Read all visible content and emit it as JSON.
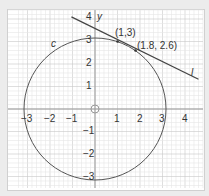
{
  "chart_data": {
    "type": "line",
    "title": "",
    "xlabel": "",
    "ylabel": "y",
    "xlim": [
      -3.3,
      4.6
    ],
    "ylim": [
      -3.3,
      4.0
    ],
    "grid": true,
    "x_ticks": [
      "-3",
      "-2",
      "-1",
      "1",
      "2",
      "3",
      "4"
    ],
    "y_ticks": [
      "4",
      "3",
      "2",
      "1",
      "-1",
      "-2",
      "-3"
    ],
    "series": [
      {
        "name": "c",
        "kind": "circle",
        "center": [
          0,
          0
        ],
        "radius": 3.162,
        "equation": "x^2 + y^2 = 10"
      },
      {
        "name": "l",
        "kind": "line",
        "equation": "x + 3y = 10",
        "x_range": [
          -1.05,
          4.6
        ]
      }
    ],
    "points": [
      {
        "label": "(1,3)",
        "x": 1,
        "y": 3
      },
      {
        "label": "(1.8, 2.6)",
        "x": 1.8,
        "y": 2.6
      }
    ],
    "annotations": [
      {
        "text": "c",
        "x": -1.8,
        "y": 2.9
      },
      {
        "text": "l",
        "x": 4.2,
        "y": 1.6
      },
      {
        "text": "y",
        "x": 0.15,
        "y": 4.0
      }
    ],
    "origin_marker": "open-circle"
  },
  "labels": {
    "y_axis": "y",
    "circle": "c",
    "line": "l",
    "point1": "(1,3)",
    "point2": "(1.8, 2.6)",
    "xt": [
      "−3",
      "−2",
      "−1",
      "1",
      "2",
      "3",
      "4"
    ],
    "yt": [
      "4",
      "3",
      "2",
      "1",
      "−1",
      "−2",
      "−3"
    ]
  },
  "colors": {
    "grid_minor": "#e6e6e6",
    "grid_major": "#c8c8c8",
    "axis": "#9a9a9a",
    "curve": "#555555",
    "line": "#444444"
  }
}
